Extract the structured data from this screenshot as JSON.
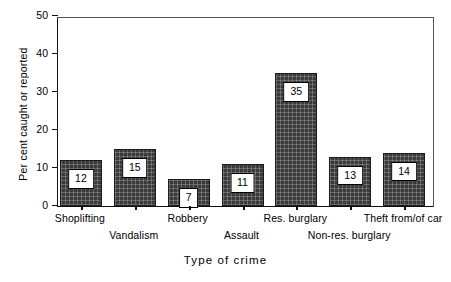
{
  "chart_data": {
    "type": "bar",
    "title": "",
    "xlabel": "Type of crime",
    "ylabel": "Per cent caught or reported",
    "categories": [
      "Shoplifting",
      "Vandalism",
      "Robbery",
      "Assault",
      "Res. burglary",
      "Non-res. burglary",
      "Theft from/of car"
    ],
    "values": [
      12,
      15,
      7,
      11,
      35,
      13,
      14
    ],
    "value_labels": [
      "12",
      "15",
      "7",
      "11",
      "35",
      "13",
      "14"
    ],
    "ylim": [
      0,
      50
    ],
    "yticks": [
      0,
      10,
      20,
      30,
      40,
      50
    ],
    "ytick_labels": [
      "0",
      "10",
      "20",
      "30",
      "40",
      "50"
    ],
    "grid": false,
    "legend": "none",
    "label_rows": [
      0,
      1,
      0,
      1,
      0,
      1,
      0
    ],
    "bar_color": "#3a3a3a",
    "bar_edge_color": "#1b1b1b",
    "axis_color": "#111111",
    "background_color": "#ffffff"
  }
}
